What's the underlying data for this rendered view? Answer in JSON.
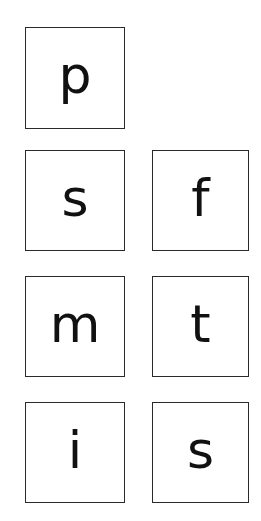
{
  "cards": [
    {
      "letter": "p"
    },
    {
      "letter": "s"
    },
    {
      "letter": "f"
    },
    {
      "letter": "m"
    },
    {
      "letter": "t"
    },
    {
      "letter": "i"
    },
    {
      "letter": "s"
    }
  ]
}
